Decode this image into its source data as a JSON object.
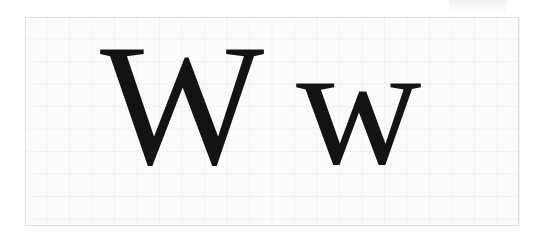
{
  "canvas": {
    "width": 542,
    "height": 238,
    "background_color": "#ffffff"
  },
  "grid": {
    "name": "graph-paper",
    "left": 25,
    "top": 17,
    "width": 495,
    "height": 210,
    "cell_size_px": 22,
    "columns": 22,
    "rows": 9,
    "line_color": "#e6e6e6",
    "paper_color": "#fdfdfd",
    "border_color": "#e2e2e2"
  },
  "specimen": {
    "letter": "W",
    "script": "Latin",
    "style": "serif",
    "ink_color": "#131313",
    "glyphs": [
      {
        "id": "uppercase",
        "char": "W",
        "case_label": "uppercase",
        "left": 100,
        "top": 18,
        "font_size_px": 174,
        "cap_height_px": 120,
        "advance_width_px": 176
      },
      {
        "id": "lowercase",
        "char": "w",
        "case_label": "lowercase",
        "left": 296,
        "top": 18,
        "font_size_px": 174,
        "x_height_px": 83,
        "advance_width_px": 120
      }
    ]
  },
  "artifact": {
    "name": "scan-smudge",
    "left": 449,
    "top": 0,
    "width": 58,
    "height": 13,
    "color": "#e4e4e8"
  }
}
